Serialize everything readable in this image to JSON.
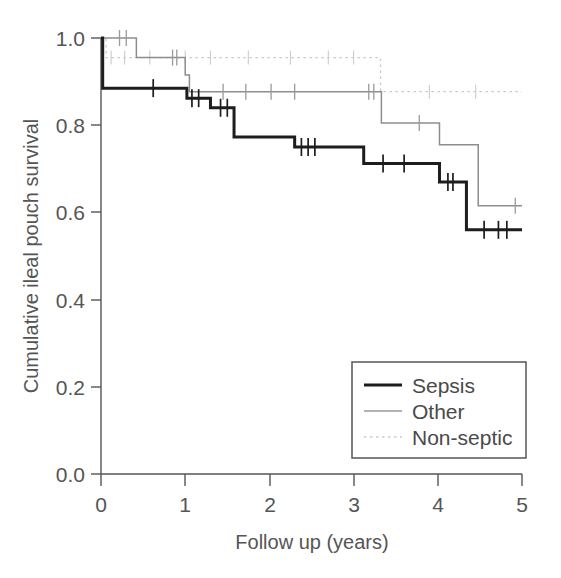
{
  "chart_data": {
    "type": "line",
    "title": "",
    "xlabel": "Follow up (years)",
    "ylabel": "Cumulative ileal pouch survival",
    "xlim": [
      0,
      5
    ],
    "ylim": [
      0.0,
      1.0
    ],
    "xticks": [
      "0",
      "1",
      "2",
      "3",
      "4",
      "5"
    ],
    "xtick_values": [
      0,
      1,
      2,
      3,
      4,
      5
    ],
    "yticks": [
      "0.0",
      "0.2",
      "0.4",
      "0.6",
      "0.8",
      "1.0"
    ],
    "ytick_values": [
      0.0,
      0.2,
      0.4,
      0.6,
      0.8,
      1.0
    ],
    "grid": false,
    "legend_position": "bottom-right",
    "plot_style": "kaplan-meier step function with censoring tick marks",
    "series": [
      {
        "name": "Sepsis",
        "color": "#1d1d1d",
        "line_style": "solid-thick",
        "steps": [
          {
            "x": 0.0,
            "y": 1.0
          },
          {
            "x": 0.02,
            "y": 0.885
          },
          {
            "x": 0.95,
            "y": 0.885
          },
          {
            "x": 1.02,
            "y": 0.862
          },
          {
            "x": 1.22,
            "y": 0.862
          },
          {
            "x": 1.3,
            "y": 0.84
          },
          {
            "x": 1.52,
            "y": 0.84
          },
          {
            "x": 1.58,
            "y": 0.773
          },
          {
            "x": 2.18,
            "y": 0.773
          },
          {
            "x": 2.3,
            "y": 0.75
          },
          {
            "x": 3.05,
            "y": 0.75
          },
          {
            "x": 3.12,
            "y": 0.712
          },
          {
            "x": 3.95,
            "y": 0.712
          },
          {
            "x": 4.02,
            "y": 0.67
          },
          {
            "x": 4.28,
            "y": 0.67
          },
          {
            "x": 4.34,
            "y": 0.56
          },
          {
            "x": 5.0,
            "y": 0.56
          }
        ],
        "censor_x": [
          0.62,
          1.08,
          1.16,
          1.42,
          1.5,
          2.38,
          2.46,
          2.54,
          3.35,
          3.6,
          4.12,
          4.18,
          4.55,
          4.72,
          4.82
        ],
        "final_value": 0.56
      },
      {
        "name": "Other",
        "color": "#8d8d8d",
        "line_style": "solid-thin",
        "steps": [
          {
            "x": 0.0,
            "y": 1.0
          },
          {
            "x": 0.38,
            "y": 1.0
          },
          {
            "x": 0.42,
            "y": 0.955
          },
          {
            "x": 0.95,
            "y": 0.955
          },
          {
            "x": 1.0,
            "y": 0.915
          },
          {
            "x": 1.05,
            "y": 0.877
          },
          {
            "x": 3.28,
            "y": 0.877
          },
          {
            "x": 3.33,
            "y": 0.805
          },
          {
            "x": 3.95,
            "y": 0.805
          },
          {
            "x": 4.02,
            "y": 0.755
          },
          {
            "x": 4.4,
            "y": 0.755
          },
          {
            "x": 4.48,
            "y": 0.615
          },
          {
            "x": 5.0,
            "y": 0.615
          }
        ],
        "censor_x": [
          0.22,
          0.3,
          0.85,
          0.9,
          1.45,
          1.72,
          2.02,
          2.3,
          3.18,
          3.24,
          3.78,
          4.92
        ],
        "final_value": 0.615
      },
      {
        "name": "Non-septic",
        "color": "#c9c9c9",
        "line_style": "dotted",
        "steps": [
          {
            "x": 0.0,
            "y": 1.0
          },
          {
            "x": 0.06,
            "y": 0.955
          },
          {
            "x": 3.28,
            "y": 0.955
          },
          {
            "x": 3.32,
            "y": 0.877
          },
          {
            "x": 5.0,
            "y": 0.877
          }
        ],
        "censor_x": [
          0.12,
          0.28,
          0.58,
          1.0,
          1.3,
          1.75,
          2.25,
          2.7,
          3.0,
          3.9,
          4.45
        ],
        "final_value": 0.877
      }
    ]
  },
  "legend": {
    "entries": [
      {
        "label": "Sepsis"
      },
      {
        "label": "Other"
      },
      {
        "label": "Non-septic"
      }
    ]
  },
  "axes": {
    "x_label": "Follow up (years)",
    "y_label": "Cumulative ileal pouch survival"
  }
}
